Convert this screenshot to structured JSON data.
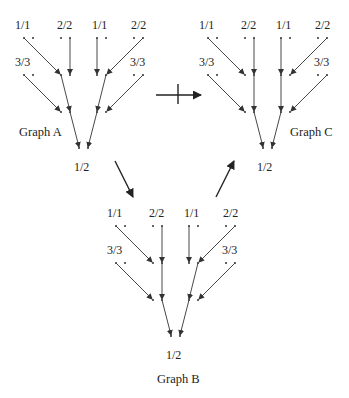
{
  "diagram": {
    "graphs": [
      {
        "id": "A",
        "caption": "Graph A",
        "top_labels": [
          "1/1",
          "2/2",
          "1/1",
          "2/2"
        ],
        "side_labels": [
          "3/3",
          "3/3"
        ],
        "root_label": "1/2"
      },
      {
        "id": "B",
        "caption": "Graph B",
        "top_labels": [
          "1/1",
          "2/2",
          "1/1",
          "2/2"
        ],
        "side_labels": [
          "3/3",
          "3/3"
        ],
        "root_label": "1/2"
      },
      {
        "id": "C",
        "caption": "Graph C",
        "top_labels": [
          "1/1",
          "2/2",
          "1/1",
          "2/2"
        ],
        "side_labels": [
          "3/3",
          "3/3"
        ],
        "root_label": "1/2"
      }
    ],
    "transitions": [
      {
        "from": "Graph A",
        "to": "Graph C",
        "type": "negated-arrow"
      },
      {
        "from": "Graph A",
        "to": "Graph B",
        "type": "arrow"
      },
      {
        "from": "Graph B",
        "to": "Graph C",
        "type": "arrow"
      }
    ],
    "colors": {
      "ink": "#222222",
      "background": "#ffffff"
    }
  }
}
